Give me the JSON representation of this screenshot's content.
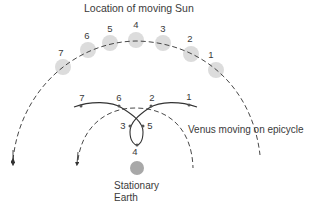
{
  "title": "Location of moving Sun",
  "sun_positions": [
    {
      "label": "1",
      "x": 216,
      "y": 70
    },
    {
      "label": "2",
      "x": 191,
      "y": 54
    },
    {
      "label": "3",
      "x": 163,
      "y": 43
    },
    {
      "label": "4",
      "x": 136,
      "y": 40
    },
    {
      "label": "5",
      "x": 110,
      "y": 43
    },
    {
      "label": "6",
      "x": 88,
      "y": 50
    },
    {
      "label": "7",
      "x": 63,
      "y": 67
    }
  ],
  "venus_positions": [
    {
      "label": "1",
      "x": 189,
      "y": 107
    },
    {
      "label": "2",
      "x": 151,
      "y": 107
    },
    {
      "label": "3",
      "x": 127,
      "y": 126
    },
    {
      "label": "4",
      "x": 135,
      "y": 141
    },
    {
      "label": "5",
      "x": 143,
      "y": 126
    },
    {
      "label": "6",
      "x": 119,
      "y": 107
    },
    {
      "label": "7",
      "x": 81,
      "y": 107
    }
  ],
  "venus_label": "Venus moving on epicycle",
  "earth_label_line1": "Stationary",
  "earth_label_line2": "Earth",
  "colors": {
    "line": "#333333",
    "sun_fill": "#dcdcdc",
    "earth_fill": "#a8a8a8",
    "text": "#3a3a3a"
  }
}
